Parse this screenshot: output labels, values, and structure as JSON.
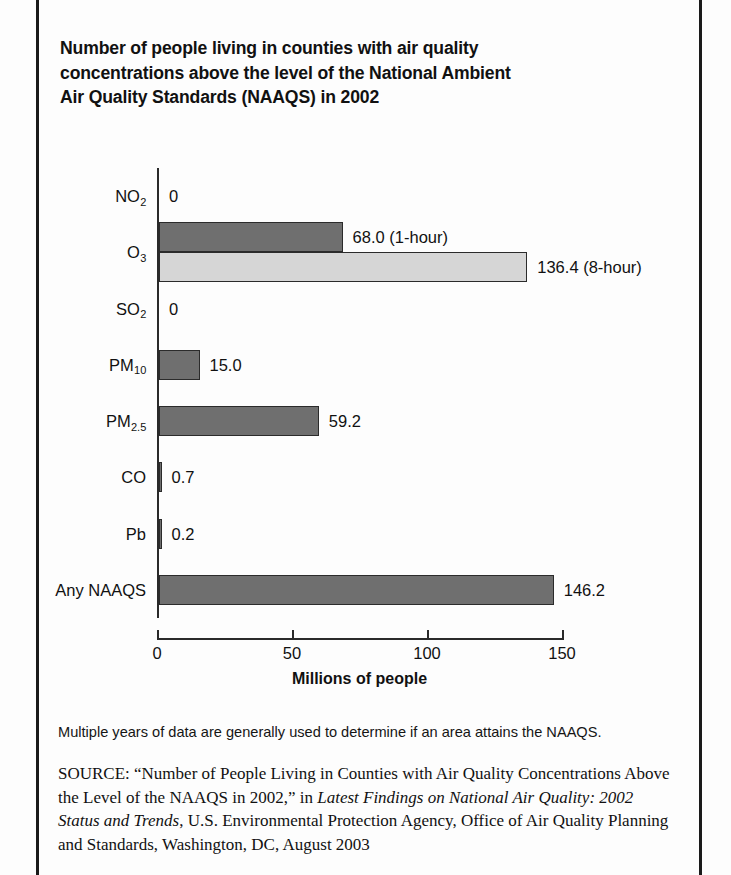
{
  "page": {
    "title": "Number of people living in counties with air quality concentrations above the level of the National Ambient Air Quality Standards (NAAQS) in 2002",
    "title_line1": "Number of people living in counties with air quality",
    "title_line2": "concentrations above the level of the National Ambient",
    "title_line3": "Air Quality Standards (NAAQS) in 2002"
  },
  "chart_data": {
    "type": "bar",
    "orientation": "horizontal",
    "title": "Number of people living in counties with air quality concentrations above the level of the National Ambient Air Quality Standards (NAAQS) in 2002",
    "xlabel": "Millions of people",
    "ylabel": "",
    "xlim": [
      0,
      150
    ],
    "xticks": [
      0,
      50,
      100,
      150
    ],
    "xtick_labels": [
      "0",
      "50",
      "100",
      "150"
    ],
    "grid": false,
    "legend": "none",
    "categories": [
      "NO2",
      "O3",
      "SO2",
      "PM10",
      "PM2.5",
      "CO",
      "Pb",
      "Any NAAQS"
    ],
    "category_labels_html": [
      "NO<sub>2</sub>",
      "O<sub>3</sub>",
      "SO<sub>2</sub>",
      "PM<sub>10</sub>",
      "PM<sub>2.5</sub>",
      "CO",
      "Pb",
      "Any NAAQS"
    ],
    "values": [
      0,
      68.0,
      0,
      15.0,
      59.2,
      0.7,
      0.2,
      146.2
    ],
    "bars": [
      {
        "category": "NO2",
        "label_html": "NO<sub>2</sub>",
        "value": 0,
        "value_label": "0",
        "shade": "dark",
        "note": ""
      },
      {
        "category": "O3",
        "label_html": "O<sub>3</sub>",
        "value": 68.0,
        "value_label": "68.0 (1-hour)",
        "shade": "dark",
        "note": "1-hour"
      },
      {
        "category": "O3",
        "label_html": "",
        "value": 136.4,
        "value_label": "136.4 (8-hour)",
        "shade": "light",
        "note": "8-hour"
      },
      {
        "category": "SO2",
        "label_html": "SO<sub>2</sub>",
        "value": 0,
        "value_label": "0",
        "shade": "dark",
        "note": ""
      },
      {
        "category": "PM10",
        "label_html": "PM<sub>10</sub>",
        "value": 15.0,
        "value_label": "15.0",
        "shade": "dark",
        "note": ""
      },
      {
        "category": "PM2.5",
        "label_html": "PM<sub>2.5</sub>",
        "value": 59.2,
        "value_label": "59.2",
        "shade": "dark",
        "note": ""
      },
      {
        "category": "CO",
        "label_html": "CO",
        "value": 0.7,
        "value_label": "0.7",
        "shade": "dark",
        "note": ""
      },
      {
        "category": "Pb",
        "label_html": "Pb",
        "value": 0.2,
        "value_label": "0.2",
        "shade": "dark",
        "note": ""
      },
      {
        "category": "Any NAAQS",
        "label_html": "Any NAAQS",
        "value": 146.2,
        "value_label": "146.2",
        "shade": "dark",
        "note": ""
      }
    ],
    "colors": {
      "bar_dark": "#6f6f6f",
      "bar_light": "#d6d6d6",
      "bar_outline": "#2b2b2b",
      "axis": "#2a2a2a",
      "text": "#111111"
    }
  },
  "axis": {
    "xlabel": "Millions of people",
    "tick_labels": [
      "0",
      "50",
      "100",
      "150"
    ]
  },
  "notes": {
    "footnote": "Multiple years of data are generally used to determine if an area attains the NAAQS.",
    "source_lead": "SOURCE:",
    "source_part1": "“Number of People Living in Counties with Air Quality Concentrations Above the Level of the NAAQS in 2002,” in ",
    "source_italic": "Latest Findings on National Air Quality: 2002 Status and Trends",
    "source_part2": ", U.S. Environmental Protection Agency, Office of Air Quality Planning and Standards, Washington, DC, August 2003"
  }
}
